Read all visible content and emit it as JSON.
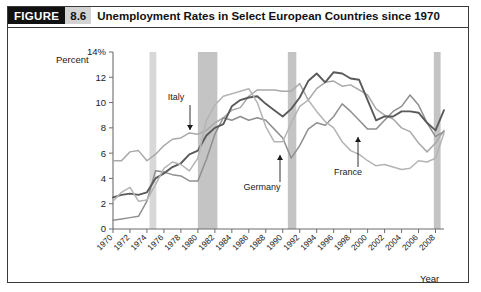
{
  "figure": {
    "badge_label": "FIGURE",
    "number": "8.6",
    "title": "Unemployment Rates in Select European Countries since 1970"
  },
  "chart_data": {
    "type": "line",
    "title": "Unemployment Rates in Select European Countries since 1970",
    "xlabel": "Year",
    "ylabel": "Percent",
    "ylim": [
      0,
      14
    ],
    "xlim": [
      1970,
      2009
    ],
    "grid": false,
    "legend_position": "inline-annotations",
    "ytick_labels": [
      "0",
      "2",
      "4",
      "6",
      "8",
      "10",
      "12",
      "14%"
    ],
    "ytick_values": [
      0,
      2,
      4,
      6,
      8,
      10,
      12,
      14
    ],
    "xtick_labels": [
      "1970",
      "1972",
      "1974",
      "1976",
      "1978",
      "1980",
      "1982",
      "1984",
      "1986",
      "1988",
      "1990",
      "1992",
      "1994",
      "1996",
      "1998",
      "2000",
      "2002",
      "2004",
      "2006",
      "2008"
    ],
    "xtick_values": [
      1970,
      1972,
      1974,
      1976,
      1978,
      1980,
      1982,
      1984,
      1986,
      1988,
      1990,
      1992,
      1994,
      1996,
      1998,
      2000,
      2002,
      2004,
      2006,
      2008
    ],
    "x": [
      1970,
      1971,
      1972,
      1973,
      1974,
      1975,
      1976,
      1977,
      1978,
      1979,
      1980,
      1981,
      1982,
      1983,
      1984,
      1985,
      1986,
      1987,
      1988,
      1989,
      1990,
      1991,
      1992,
      1993,
      1994,
      1995,
      1996,
      1997,
      1998,
      1999,
      2000,
      2001,
      2002,
      2003,
      2004,
      2005,
      2006,
      2007,
      2008,
      2009
    ],
    "series": [
      {
        "name": "Italy",
        "color": "#a9a9a9",
        "annotation": "Italy",
        "values": [
          5.4,
          5.4,
          6.1,
          6.2,
          5.4,
          5.9,
          6.6,
          7.1,
          7.2,
          7.6,
          7.5,
          7.8,
          8.4,
          8.8,
          9.4,
          9.6,
          10.5,
          11.0,
          11.0,
          11.0,
          10.9,
          10.9,
          11.5,
          10.2,
          11.1,
          11.6,
          11.7,
          11.3,
          11.4,
          11.0,
          10.6,
          9.5,
          9.0,
          8.7,
          8.0,
          7.7,
          6.8,
          6.1,
          6.8,
          7.8
        ]
      },
      {
        "name": "Germany",
        "color": "#8f8f8f",
        "annotation": "Germany",
        "values": [
          0.7,
          0.8,
          0.9,
          1.0,
          2.2,
          4.6,
          4.5,
          4.3,
          4.2,
          3.8,
          3.8,
          5.5,
          7.5,
          8.8,
          8.6,
          8.9,
          8.6,
          8.8,
          8.6,
          7.9,
          7.2,
          5.6,
          6.6,
          7.9,
          8.4,
          8.2,
          8.9,
          9.9,
          9.3,
          8.6,
          7.9,
          7.9,
          8.6,
          9.3,
          9.7,
          10.6,
          9.8,
          8.4,
          7.3,
          7.7
        ]
      },
      {
        "name": "France",
        "color": "#5a5a5a",
        "annotation": "France",
        "values": [
          2.5,
          2.7,
          2.8,
          2.7,
          2.9,
          4.0,
          4.4,
          4.9,
          5.2,
          5.9,
          6.2,
          7.4,
          8.0,
          8.3,
          9.7,
          10.2,
          10.4,
          10.5,
          9.9,
          9.4,
          8.9,
          9.5,
          10.4,
          11.7,
          12.3,
          11.6,
          12.4,
          12.3,
          11.9,
          11.8,
          10.2,
          8.6,
          8.9,
          8.9,
          9.3,
          9.3,
          9.2,
          8.4,
          7.8,
          9.4
        ]
      },
      {
        "name": "United Kingdom",
        "color": "#b4b4b4",
        "annotation": "",
        "values": [
          2.2,
          2.9,
          3.3,
          2.2,
          2.3,
          3.5,
          4.8,
          5.3,
          5.1,
          4.6,
          5.6,
          8.6,
          9.8,
          10.5,
          10.7,
          10.9,
          11.1,
          10.0,
          8.1,
          6.9,
          6.9,
          8.4,
          9.7,
          10.2,
          9.3,
          8.5,
          8.0,
          6.9,
          6.2,
          5.9,
          5.4,
          5.0,
          5.1,
          4.9,
          4.7,
          4.8,
          5.4,
          5.3,
          5.6,
          7.6
        ]
      }
    ],
    "recession_bands": [
      {
        "start": 1974.3,
        "end": 1975.1,
        "shade": "light"
      },
      {
        "start": 1980.0,
        "end": 1982.3,
        "shade": "dark"
      },
      {
        "start": 1990.6,
        "end": 1991.6,
        "shade": "dark"
      },
      {
        "start": 2007.8,
        "end": 2008.6,
        "shade": "dark"
      }
    ],
    "annotations": [
      {
        "label": "Italy",
        "text_x": 176,
        "text_y": 100,
        "arrow_from_y": 105,
        "arrow_to_y": 130,
        "arrow_x": 190,
        "direction": "down"
      },
      {
        "label": "Germany",
        "text_x": 262,
        "text_y": 190,
        "arrow_from_y": 182,
        "arrow_to_y": 155,
        "arrow_x": 280,
        "direction": "up"
      },
      {
        "label": "France",
        "text_x": 348,
        "text_y": 175,
        "arrow_from_y": 167,
        "arrow_to_y": 137,
        "arrow_x": 358,
        "direction": "up"
      }
    ],
    "colors": {
      "band": "#c4c4c4",
      "band_light": "#d8d8d8",
      "axis": "#6d6d6d",
      "text": "#1a1a1a",
      "badge_bg": "#111111",
      "number_bg": "#d3d3d3"
    }
  }
}
